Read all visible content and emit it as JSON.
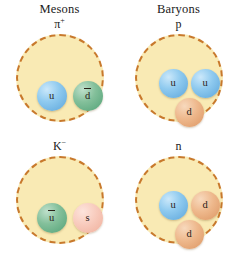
{
  "figure": {
    "columns": [
      {
        "name": "mesons",
        "title": "Mesons"
      },
      {
        "name": "baryons",
        "title": "Baryons"
      }
    ],
    "hadrons": [
      {
        "id": "pi-plus",
        "label_base": "π",
        "label_sup": "+",
        "category": "meson",
        "quarks": [
          {
            "symbol": "u",
            "flavor": "up",
            "antiparticle": false,
            "color": "#8fcaef"
          },
          {
            "symbol": "d",
            "flavor": "down",
            "antiparticle": true,
            "color": "#84c09b"
          }
        ]
      },
      {
        "id": "proton",
        "label_base": "p",
        "label_sup": "",
        "category": "baryon",
        "quarks": [
          {
            "symbol": "u",
            "flavor": "up",
            "antiparticle": false,
            "color": "#8fcaef"
          },
          {
            "symbol": "u",
            "flavor": "up",
            "antiparticle": false,
            "color": "#8fcaef"
          },
          {
            "symbol": "d",
            "flavor": "down",
            "antiparticle": false,
            "color": "#eeb88c"
          }
        ]
      },
      {
        "id": "k-minus",
        "label_base": "K",
        "label_sup": "−",
        "category": "meson",
        "quarks": [
          {
            "symbol": "u",
            "flavor": "up",
            "antiparticle": true,
            "color": "#84c09b"
          },
          {
            "symbol": "s",
            "flavor": "strange",
            "antiparticle": false,
            "color": "#f8cbbd"
          }
        ]
      },
      {
        "id": "neutron",
        "label_base": "n",
        "label_sup": "",
        "category": "baryon",
        "quarks": [
          {
            "symbol": "u",
            "flavor": "up",
            "antiparticle": false,
            "color": "#8fcaef"
          },
          {
            "symbol": "d",
            "flavor": "down",
            "antiparticle": false,
            "color": "#eeb88c"
          },
          {
            "symbol": "d",
            "flavor": "down",
            "antiparticle": false,
            "color": "#eeb88c"
          }
        ]
      }
    ],
    "colors": {
      "containment_fill": "#f9eab4",
      "containment_border": "#c8792c",
      "background": "#ffffff",
      "text": "#1a1a1a"
    }
  }
}
